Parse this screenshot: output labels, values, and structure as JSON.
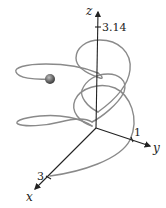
{
  "diagram": {
    "type": "3d-space-curve",
    "axes": {
      "x": {
        "label": "x",
        "tick_label": "3"
      },
      "y": {
        "label": "y",
        "tick_label": "1"
      },
      "z": {
        "label": "z",
        "tick_label": "3.14"
      }
    },
    "curve": {
      "color": "#8a8a8a",
      "description": "looping helical space curve"
    },
    "marker": {
      "type": "sphere",
      "color": "#555555"
    },
    "axis_color": "#222222"
  }
}
